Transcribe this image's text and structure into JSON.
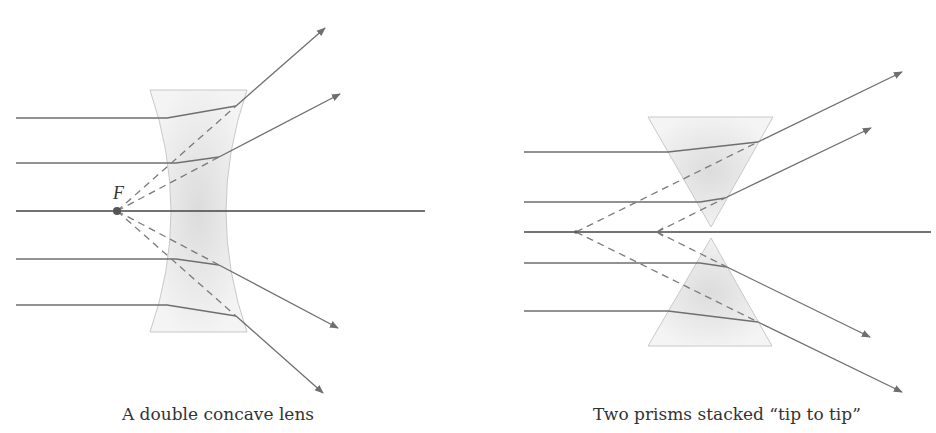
{
  "left_diagram": {
    "caption": "A double concave lens",
    "focal_label": "F"
  },
  "right_diagram": {
    "caption": "Two prisms stacked “tip to tip”"
  },
  "colors": {
    "ray": "#6f6f6f",
    "axis": "#444444",
    "outline": "#c8c8c8",
    "fill": "#e6e6e6",
    "caption": "#333333"
  }
}
